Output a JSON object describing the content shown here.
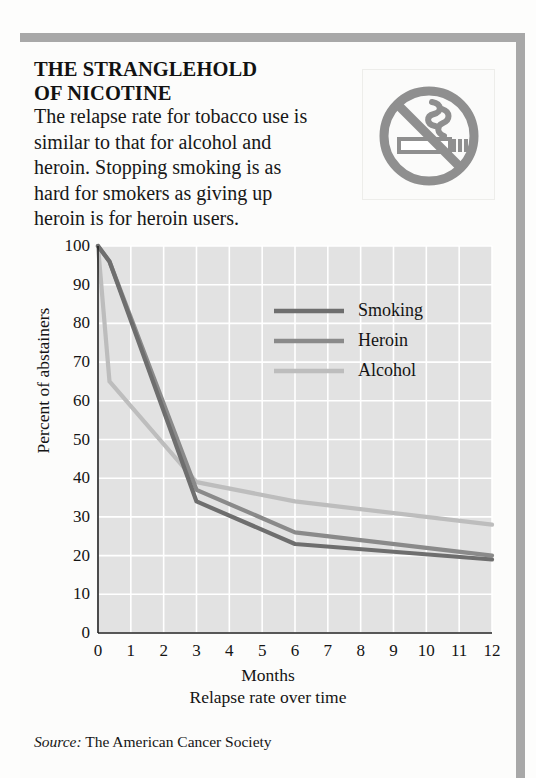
{
  "headline": {
    "line1": "THE STRANGLEHOLD",
    "line2": "OF NICOTINE"
  },
  "deck": {
    "line1": "The relapse rate for tobacco use is",
    "line2": "similar to that for alcohol and",
    "line3": "heroin. Stopping smoking is as",
    "line4": "hard for smokers as giving up",
    "line5": "heroin is for heroin users."
  },
  "badge": {
    "icon": "no-smoking-icon",
    "color": "#8f8f8f"
  },
  "source": {
    "prefix": "Source:",
    "text": "The American Cancer Society"
  },
  "chart_data": {
    "type": "line",
    "title": "",
    "subtitle": "Relapse rate over time",
    "xlabel": "Months",
    "ylabel": "Percent of abstainers",
    "xlim": [
      0,
      12
    ],
    "ylim": [
      0,
      100
    ],
    "xticks": [
      "0",
      "1",
      "2",
      "3",
      "4",
      "5",
      "6",
      "7",
      "8",
      "9",
      "10",
      "11",
      "12"
    ],
    "yticks": [
      "0",
      "10",
      "20",
      "30",
      "40",
      "50",
      "60",
      "70",
      "80",
      "90",
      "100"
    ],
    "grid": true,
    "legend_position": "upper-right-inside",
    "plot_background": "#e2e2e2",
    "gridline_color": "#ffffff",
    "x": [
      0,
      0.35,
      3,
      6,
      12
    ],
    "series": [
      {
        "name": "Smoking",
        "color": "#6e6e6e",
        "values": [
          100,
          96,
          34,
          23,
          19
        ]
      },
      {
        "name": "Heroin",
        "color": "#8a8a8a",
        "values": [
          100,
          96,
          37,
          26,
          20
        ]
      },
      {
        "name": "Alcohol",
        "color": "#bdbdbd",
        "values": [
          100,
          65,
          39,
          34,
          28
        ]
      }
    ]
  }
}
